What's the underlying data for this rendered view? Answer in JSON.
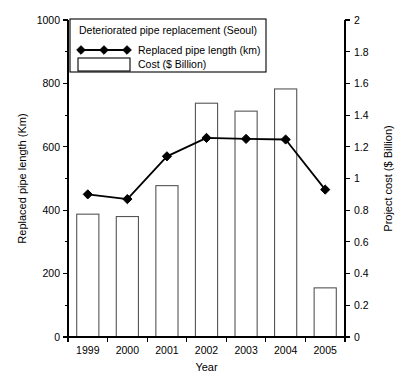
{
  "chart_data": {
    "type": "bar",
    "title": "Deteriorated pipe replacement (Seoul)",
    "xlabel": "Year",
    "ylabel": "Replaced pipe length (Km)",
    "y2label": "Project cost ($ Billion)",
    "categories": [
      "1999",
      "2000",
      "2001",
      "2002",
      "2003",
      "2004",
      "2005"
    ],
    "ylim": [
      0,
      1000
    ],
    "yticks": [
      0,
      200,
      400,
      600,
      800,
      1000
    ],
    "yticklabels": [
      "0",
      "200",
      "400",
      "600",
      "800",
      "1000"
    ],
    "yminorticks": [
      100,
      300,
      500,
      700,
      900
    ],
    "y2lim": [
      0,
      2
    ],
    "y2ticks": [
      0,
      0.2,
      0.4,
      0.6,
      0.8,
      1,
      1.2,
      1.4,
      1.6,
      1.8,
      2
    ],
    "y2ticklabels": [
      "0",
      "0.2",
      "0.4",
      "0.6",
      "0.8",
      "1",
      "1.2",
      "1.4",
      "1.6",
      "1.8",
      "2"
    ],
    "grid": false,
    "legend_position": "top-left-inside",
    "series": [
      {
        "name": "Replaced pipe length (km)",
        "type": "line",
        "axis": "left",
        "unit": "km",
        "color": "#000000",
        "marker": "diamond",
        "values": [
          450,
          435,
          570,
          628,
          625,
          623,
          465
        ]
      },
      {
        "name": "Cost ($ Billion)",
        "type": "bar",
        "axis": "right",
        "unit": "$ Billion",
        "color": "#ffffff",
        "edge_color": "#555555",
        "values": [
          0.775,
          0.76,
          0.955,
          1.475,
          1.425,
          1.565,
          0.31
        ]
      }
    ]
  },
  "legend": {
    "title": "Deteriorated pipe replacement (Seoul)",
    "entries": [
      {
        "label": "Replaced pipe length (km)",
        "marker": "line-diamond"
      },
      {
        "label": "Cost ($ Billion)",
        "marker": "box"
      }
    ]
  }
}
